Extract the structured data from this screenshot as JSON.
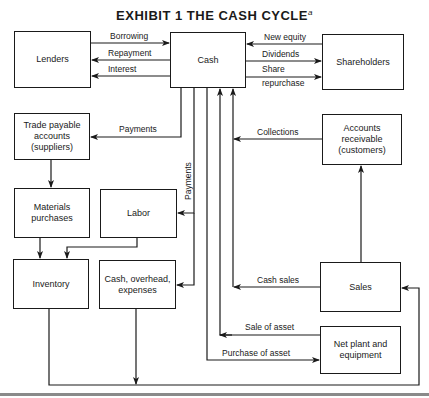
{
  "title": {
    "text": "EXHIBIT 1   THE CASH CYCLE",
    "footnote_marker": "a"
  },
  "nodes": {
    "lenders": "Lenders",
    "cash": "Cash",
    "shareholders": "Shareholders",
    "trade_payable": "Trade payable accounts (suppliers)",
    "materials": "Materials purchases",
    "labor": "Labor",
    "inventory": "Inventory",
    "overhead": "Cash, overhead, expenses",
    "receivable": "Accounts receivable (customers)",
    "sales": "Sales",
    "plant": "Net plant and equipment"
  },
  "flows": {
    "borrowing": "Borrowing",
    "repayment": "Repayment",
    "interest": "Interest",
    "new_equity": "New equity",
    "dividends": "Dividends",
    "share_repurchase_1": "Share",
    "share_repurchase_2": "repurchase",
    "payments_suppliers": "Payments",
    "payments_labor": "Payments",
    "collections": "Collections",
    "cash_sales": "Cash sales",
    "sale_of_asset": "Sale of asset",
    "purchase_of_asset": "Purchase of asset"
  },
  "edges": [
    {
      "from": "Lenders",
      "to": "Cash",
      "label": "Borrowing"
    },
    {
      "from": "Cash",
      "to": "Lenders",
      "label": "Repayment"
    },
    {
      "from": "Cash",
      "to": "Lenders",
      "label": "Interest"
    },
    {
      "from": "Shareholders",
      "to": "Cash",
      "label": "New equity"
    },
    {
      "from": "Cash",
      "to": "Shareholders",
      "label": "Dividends"
    },
    {
      "from": "Cash",
      "to": "Shareholders",
      "label": "Share repurchase"
    },
    {
      "from": "Cash",
      "to": "Trade payable accounts (suppliers)",
      "label": "Payments"
    },
    {
      "from": "Cash",
      "to": "Labor",
      "label": "Payments"
    },
    {
      "from": "Cash",
      "to": "Cash, overhead, expenses",
      "label": "Payments"
    },
    {
      "from": "Trade payable accounts (suppliers)",
      "to": "Materials purchases",
      "label": ""
    },
    {
      "from": "Materials purchases",
      "to": "Inventory",
      "label": ""
    },
    {
      "from": "Labor",
      "to": "Inventory",
      "label": ""
    },
    {
      "from": "Inventory",
      "to": "Sales",
      "label": ""
    },
    {
      "from": "Cash, overhead, expenses",
      "to": "Sales",
      "label": ""
    },
    {
      "from": "Sales",
      "to": "Accounts receivable (customers)",
      "label": ""
    },
    {
      "from": "Accounts receivable (customers)",
      "to": "Cash",
      "label": "Collections"
    },
    {
      "from": "Sales",
      "to": "Cash",
      "label": "Cash sales"
    },
    {
      "from": "Net plant and equipment",
      "to": "Cash",
      "label": "Sale of asset"
    },
    {
      "from": "Cash",
      "to": "Net plant and equipment",
      "label": "Purchase of asset"
    }
  ]
}
